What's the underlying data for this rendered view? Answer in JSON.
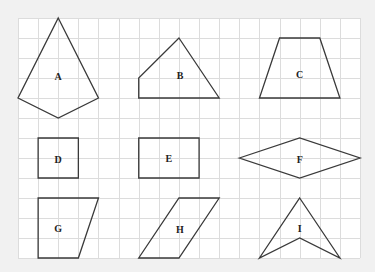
{
  "diagram": {
    "colors": {
      "page_background": "#f1f1f1",
      "grid_background": "#ffffff",
      "grid_line": "#dcdcdc",
      "shape_stroke": "#3a3a3a",
      "label": "#222222"
    },
    "grid": {
      "origin_x": 18,
      "origin_y": 18,
      "step_x": 20.12,
      "step_y": 20,
      "columns": 17,
      "rows": 12
    },
    "shapes": [
      {
        "label": "A",
        "kind": "kite",
        "points": [
          [
            2,
            0
          ],
          [
            4,
            4
          ],
          [
            2,
            5
          ],
          [
            0,
            4
          ]
        ],
        "label_pos": [
          2,
          2.9
        ]
      },
      {
        "label": "B",
        "kind": "pentagon-like quadrilateral",
        "points": [
          [
            8,
            1
          ],
          [
            10,
            4
          ],
          [
            6,
            4
          ],
          [
            6,
            3
          ]
        ],
        "label_pos": [
          8.05,
          2.85
        ]
      },
      {
        "label": "C",
        "kind": "trapezoid",
        "points": [
          [
            13,
            1
          ],
          [
            15,
            1
          ],
          [
            16,
            4
          ],
          [
            12,
            4
          ]
        ],
        "label_pos": [
          14,
          2.8
        ]
      },
      {
        "label": "D",
        "kind": "square",
        "points": [
          [
            1,
            6
          ],
          [
            3,
            6
          ],
          [
            3,
            8
          ],
          [
            1,
            8
          ]
        ],
        "label_pos": [
          2,
          7.05
        ]
      },
      {
        "label": "E",
        "kind": "rectangle",
        "points": [
          [
            6,
            6
          ],
          [
            9,
            6
          ],
          [
            9,
            8
          ],
          [
            6,
            8
          ]
        ],
        "label_pos": [
          7.5,
          7
        ]
      },
      {
        "label": "F",
        "kind": "rhombus",
        "points": [
          [
            11,
            7
          ],
          [
            14,
            6
          ],
          [
            17,
            7
          ],
          [
            14,
            8
          ]
        ],
        "label_pos": [
          14,
          7.05
        ]
      },
      {
        "label": "G",
        "kind": "right trapezoid",
        "points": [
          [
            1,
            9
          ],
          [
            4,
            9
          ],
          [
            3,
            12
          ],
          [
            1,
            12
          ]
        ],
        "label_pos": [
          2,
          10.5
        ]
      },
      {
        "label": "H",
        "kind": "parallelogram",
        "points": [
          [
            8,
            9
          ],
          [
            10,
            9
          ],
          [
            8,
            12
          ],
          [
            6,
            12
          ]
        ],
        "label_pos": [
          8.05,
          10.55
        ]
      },
      {
        "label": "I",
        "kind": "concave dart",
        "points": [
          [
            14,
            9
          ],
          [
            16,
            12
          ],
          [
            14,
            11
          ],
          [
            12,
            12
          ]
        ],
        "label_pos": [
          14,
          10.5
        ]
      }
    ]
  }
}
